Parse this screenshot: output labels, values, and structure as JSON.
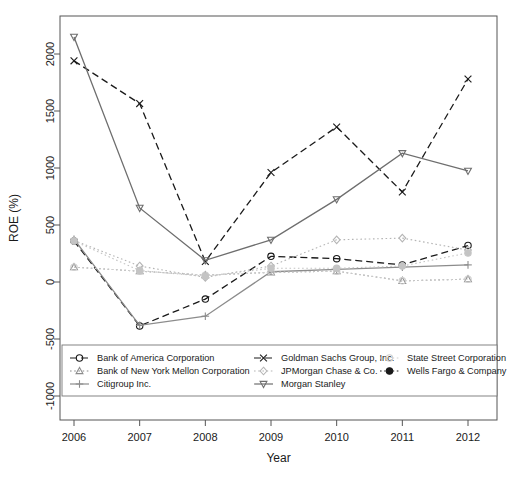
{
  "chart_data": {
    "type": "line",
    "title": "",
    "xlabel": "Year",
    "ylabel": "ROE (%)",
    "x": [
      2006,
      2007,
      2008,
      2009,
      2010,
      2011,
      2012
    ],
    "xticklabels": [
      "2006",
      "2007",
      "2008",
      "2009",
      "2010",
      "2011",
      "2012"
    ],
    "yticklabels": [
      "-1000",
      "-500",
      "0",
      "500",
      "1000",
      "1500",
      "2000"
    ],
    "yticks": [
      -1000,
      -500,
      0,
      500,
      1000,
      1500,
      2000
    ],
    "xlim": [
      2005.7,
      2012.3
    ],
    "ylim": [
      -1100,
      2300
    ],
    "grid": false,
    "legend_position": "bottom-inside",
    "series": [
      {
        "name": "Bank of America Corporation",
        "marker": "circle",
        "linestyle": "dashed",
        "color": "#1a1a1a",
        "values": [
          360,
          -385,
          -150,
          225,
          205,
          150,
          320
        ]
      },
      {
        "name": "Bank of New York Mellon Corporation",
        "marker": "triangle-up",
        "linestyle": "dotted",
        "color": "#8c8c8c",
        "values": [
          130,
          95,
          60,
          85,
          95,
          10,
          25
        ]
      },
      {
        "name": "Citigroup Inc.",
        "marker": "plus",
        "linestyle": "solid",
        "color": "#8c8c8c",
        "values": [
          375,
          -380,
          -300,
          90,
          110,
          130,
          150
        ]
      },
      {
        "name": "Goldman Sachs Group, Inc.",
        "marker": "x",
        "linestyle": "dashed",
        "color": "#1a1a1a",
        "values": [
          1940,
          1565,
          180,
          960,
          1360,
          790,
          1780
        ]
      },
      {
        "name": "JPMorgan Chase & Co.",
        "marker": "diamond",
        "linestyle": "dotted",
        "color": "#b5b5b5",
        "values": [
          365,
          140,
          40,
          140,
          370,
          385,
          280
        ]
      },
      {
        "name": "Morgan Stanley",
        "marker": "triangle-down",
        "linestyle": "solid",
        "color": "#6e6e6e",
        "values": [
          2150,
          650,
          190,
          370,
          725,
          1130,
          975
        ]
      },
      {
        "name": "State Street Corporation",
        "marker": "circle-open",
        "linestyle": "dotted",
        "color": "#cfcfcf",
        "values": [
          130,
          95,
          60,
          85,
          95,
          10,
          25
        ]
      },
      {
        "name": "Wells Fargo & Company",
        "marker": "circle-filled",
        "linestyle": "dotted",
        "color": "#c4c4c4",
        "values": [
          360,
          100,
          50,
          120,
          120,
          140,
          255
        ]
      }
    ],
    "legend": [
      {
        "label": "Bank of America Corporation",
        "marker": "circle",
        "linestyle": "dashed",
        "color": "#1a1a1a"
      },
      {
        "label": "Bank of New York Mellon Corporation",
        "marker": "triangle-up",
        "linestyle": "dotted",
        "color": "#8c8c8c"
      },
      {
        "label": "Citigroup Inc.",
        "marker": "plus",
        "linestyle": "solid",
        "color": "#8c8c8c"
      },
      {
        "label": "Goldman Sachs Group, Inc.",
        "marker": "x",
        "linestyle": "dashed",
        "color": "#1a1a1a"
      },
      {
        "label": "JPMorgan Chase & Co.",
        "marker": "diamond",
        "linestyle": "dotted",
        "color": "#b5b5b5"
      },
      {
        "label": "Morgan Stanley",
        "marker": "triangle-down",
        "linestyle": "solid",
        "color": "#6e6e6e"
      },
      {
        "label": "State Street Corporation",
        "marker": "circle-open",
        "linestyle": "dotted",
        "color": "#cfcfcf"
      },
      {
        "label": "Wells Fargo & Company",
        "marker": "circle-filled",
        "linestyle": "dotted",
        "color": "#1a1a1a"
      }
    ]
  }
}
